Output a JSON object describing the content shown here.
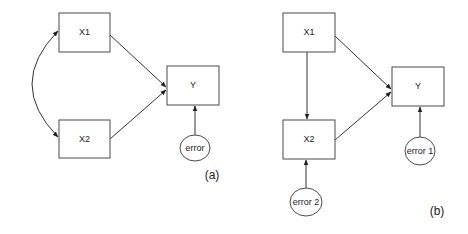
{
  "diagram_a": {
    "caption": "(a)",
    "nodes": {
      "x1": "X1",
      "x2": "X2",
      "y": "Y",
      "error": "error"
    },
    "edges": [
      {
        "from": "X1",
        "to": "Y",
        "type": "directed"
      },
      {
        "from": "X2",
        "to": "Y",
        "type": "directed"
      },
      {
        "from": "error",
        "to": "Y",
        "type": "directed"
      },
      {
        "from": "X1",
        "to": "X2",
        "type": "bidirectional-curved"
      }
    ]
  },
  "diagram_b": {
    "caption": "(b)",
    "nodes": {
      "x1": "X1",
      "x2": "X2",
      "y": "Y",
      "error1": "error 1",
      "error2": "error 2"
    },
    "edges": [
      {
        "from": "X1",
        "to": "Y",
        "type": "directed"
      },
      {
        "from": "X2",
        "to": "Y",
        "type": "directed"
      },
      {
        "from": "X1",
        "to": "X2",
        "type": "directed"
      },
      {
        "from": "error 1",
        "to": "Y",
        "type": "directed"
      },
      {
        "from": "error 2",
        "to": "X2",
        "type": "directed"
      }
    ]
  },
  "colors": {
    "stroke": "#4a4a4a",
    "text": "#222222",
    "background": "#ffffff"
  }
}
